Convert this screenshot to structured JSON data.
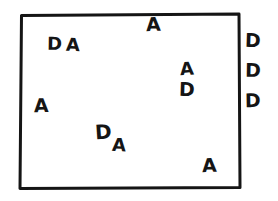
{
  "diagram": {
    "type": "hand-drawn-sketch",
    "background_color": "#ffffff",
    "ink_color": "#151515",
    "border": {
      "name": "rectangle-border",
      "stroke_color": "#151515",
      "stroke_width": 3,
      "x": 19,
      "y": 13,
      "width": 221,
      "height": 175
    },
    "inside_letters": [
      {
        "id": "letter-a-top",
        "text": "A",
        "x": 146,
        "y": 15,
        "size": 19,
        "rotate": -2
      },
      {
        "id": "letter-d-upper-left",
        "text": "D",
        "x": 47,
        "y": 35,
        "size": 18,
        "rotate": 1
      },
      {
        "id": "letter-a-upper-left",
        "text": "A",
        "x": 66,
        "y": 36,
        "size": 18,
        "rotate": 2
      },
      {
        "id": "letter-a-right-upper",
        "text": "A",
        "x": 180,
        "y": 60,
        "size": 18,
        "rotate": -3
      },
      {
        "id": "letter-d-right-lower",
        "text": "D",
        "x": 179,
        "y": 80,
        "size": 19,
        "rotate": 2
      },
      {
        "id": "letter-a-left-middle",
        "text": "A",
        "x": 34,
        "y": 96,
        "size": 19,
        "rotate": -1
      },
      {
        "id": "letter-d-lower-middle",
        "text": "D",
        "x": 95,
        "y": 122,
        "size": 20,
        "rotate": -4
      },
      {
        "id": "letter-a-lower-middle",
        "text": "A",
        "x": 112,
        "y": 136,
        "size": 18,
        "rotate": 3
      },
      {
        "id": "letter-a-bottom-right",
        "text": "A",
        "x": 202,
        "y": 156,
        "size": 19,
        "rotate": -2
      }
    ],
    "outside_letters": [
      {
        "id": "letter-d-outer-top",
        "text": "D",
        "x": 245,
        "y": 31,
        "size": 19,
        "rotate": 2
      },
      {
        "id": "letter-d-outer-middle",
        "text": "D",
        "x": 245,
        "y": 61,
        "size": 19,
        "rotate": 1
      },
      {
        "id": "letter-d-outer-bottom",
        "text": "D",
        "x": 245,
        "y": 91,
        "size": 19,
        "rotate": -1
      }
    ],
    "counts": {
      "a_inside": 6,
      "d_inside": 3,
      "d_outside": 3
    }
  }
}
